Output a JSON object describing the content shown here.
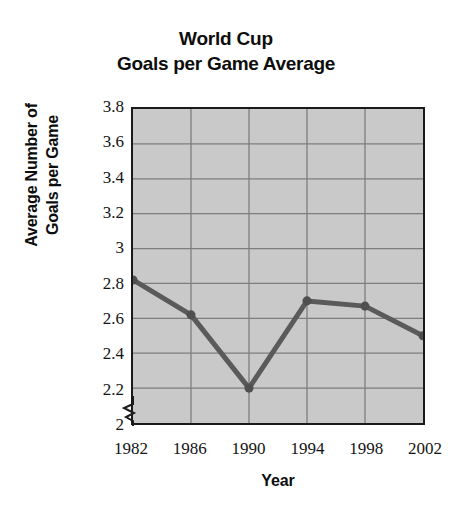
{
  "chart_data": {
    "type": "line",
    "title": "World Cup Goals per Game Average",
    "title_line1": "World Cup",
    "title_line2": "Goals per Game Average",
    "xlabel": "Year",
    "ylabel": "Average Number of Goals per Game",
    "ylabel_line1": "Average Number of",
    "ylabel_line2": "Goals per Game",
    "categories": [
      "1982",
      "1986",
      "1990",
      "1994",
      "1998",
      "2002"
    ],
    "x": [
      1982,
      1986,
      1990,
      1994,
      1998,
      2002
    ],
    "values": [
      2.82,
      2.62,
      2.2,
      2.7,
      2.67,
      2.5
    ],
    "series": [
      {
        "name": "Average Number of Goals per Game",
        "values": [
          2.82,
          2.62,
          2.2,
          2.7,
          2.67,
          2.5
        ]
      }
    ],
    "ylim": [
      2,
      3.8
    ],
    "yticks": [
      "2",
      "2.2",
      "2.4",
      "2.6",
      "2.8",
      "3",
      "3.2",
      "3.4",
      "3.6",
      "3.8"
    ],
    "ytick_values": [
      2,
      2.2,
      2.4,
      2.6,
      2.8,
      3,
      3.2,
      3.4,
      3.6,
      3.8
    ],
    "xticks": [
      "1982",
      "1986",
      "1990",
      "1994",
      "1998",
      "2002"
    ],
    "grid": true,
    "legend": false,
    "y_axis_break": true,
    "colors": {
      "line": "#5a5a5a",
      "marker": "#4f4f4f",
      "plot_background": "#c9c9c9",
      "gridline": "#7d7d7d",
      "axis": "#1a1a1a",
      "text": "#101010",
      "page_background": "#ffffff"
    }
  }
}
